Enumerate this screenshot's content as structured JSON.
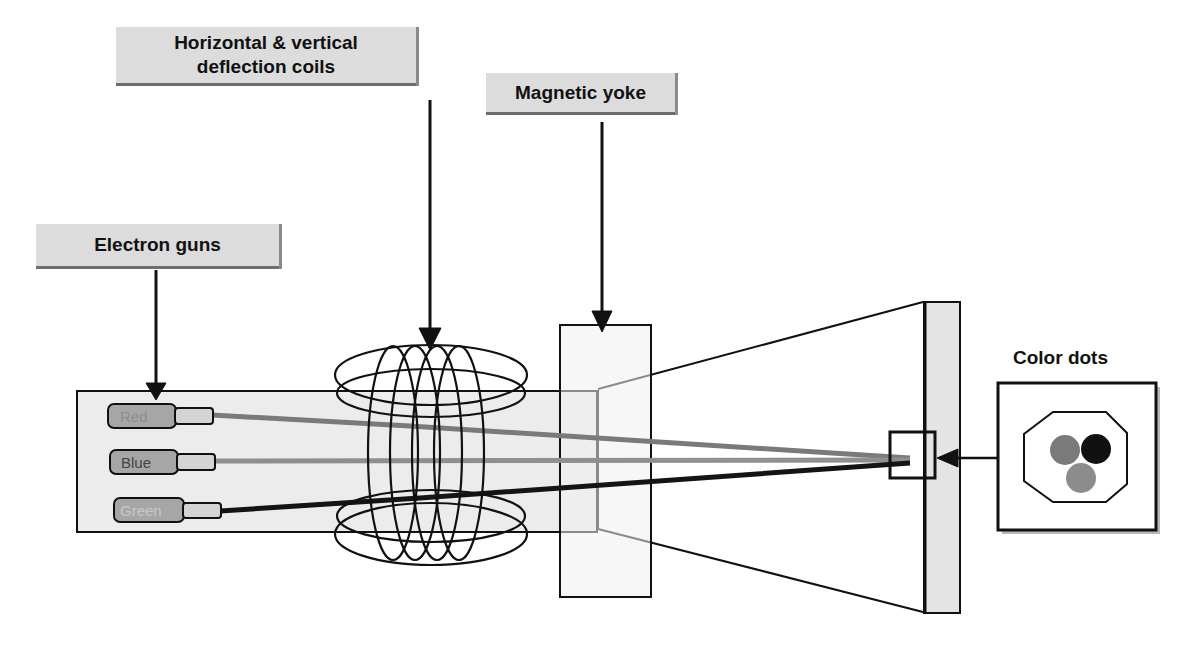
{
  "diagram": {
    "labels": {
      "deflection_coils_line1": "Horizontal & vertical",
      "deflection_coils_line2": "deflection coils",
      "magnetic_yoke": "Magnetic yoke",
      "electron_guns": "Electron guns",
      "color_dots": "Color dots"
    },
    "guns": [
      {
        "label": "Red"
      },
      {
        "label": "Blue"
      },
      {
        "label": "Green"
      }
    ],
    "color_dots": [
      {
        "name": "red-dot",
        "color": "#7a7a7a"
      },
      {
        "name": "blue-dot",
        "color": "#111111"
      },
      {
        "name": "green-dot",
        "color": "#8c8c8c"
      }
    ],
    "colors": {
      "label_fill": "#dcdcdc",
      "neck_fill": "#ececec",
      "screen_fill": "#e4e4e4",
      "line": "#111111",
      "beam_red": "#7a7a7a",
      "beam_blue": "#8f8f8f",
      "beam_green": "#141414"
    }
  }
}
